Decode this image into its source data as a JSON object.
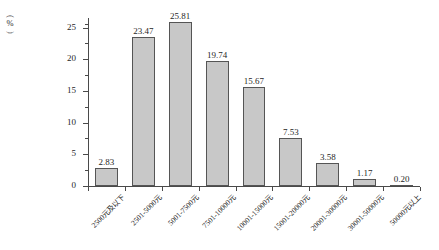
{
  "chart_data": {
    "type": "bar",
    "title": "",
    "xlabel": "",
    "ylabel": "(%)",
    "ylabel_chars": [
      "(",
      "%",
      ")"
    ],
    "categories": [
      "2500元及以下",
      "2501-5000元",
      "5001-7500元",
      "7501-10000元",
      "10001-15000元",
      "15001-20000元",
      "20001-30000元",
      "30001-50000元",
      "50000元以上"
    ],
    "values": [
      2.83,
      23.47,
      25.81,
      19.74,
      15.67,
      7.53,
      3.58,
      1.17,
      0.2
    ],
    "value_labels": [
      "2.83",
      "23.47",
      "25.81",
      "19.74",
      "15.67",
      "7.53",
      "3.58",
      "1.17",
      "0.20"
    ],
    "ylim": [
      0,
      26.5
    ],
    "yticks": [
      0,
      5,
      10,
      15,
      20,
      25
    ],
    "ytick_labels": [
      "0",
      "5",
      "10",
      "15",
      "20",
      "25"
    ],
    "yminor_ticks": [
      2.5,
      7.5,
      12.5,
      17.5,
      22.5,
      25.5
    ],
    "grid": false,
    "legend": false,
    "bar_color": "#c8c8c8",
    "bar_border_color": "#555555",
    "axis_color": "#4a4a4a",
    "background": "#ffffff"
  }
}
